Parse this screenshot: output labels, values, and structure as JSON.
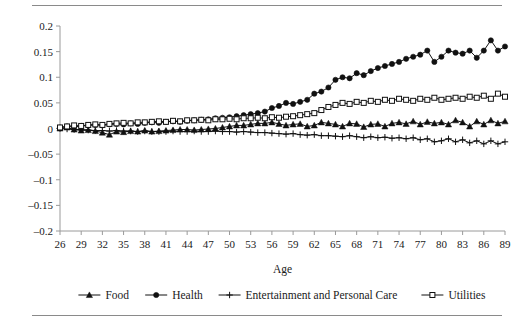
{
  "chart_data": {
    "type": "line",
    "title": "",
    "subtitle": "",
    "xlabel": "Age",
    "ylabel": "",
    "xlim": [
      26,
      89
    ],
    "ylim": [
      -0.2,
      0.2
    ],
    "grid": false,
    "legend_position": "bottom",
    "x_tick_labels": [
      "26",
      "29",
      "32",
      "35",
      "38",
      "41",
      "44",
      "47",
      "50",
      "53",
      "56",
      "59",
      "62",
      "65",
      "68",
      "71",
      "74",
      "77",
      "80",
      "83",
      "86",
      "89"
    ],
    "y_tick_labels": [
      "0.2",
      "0.15",
      "0.1",
      "0.05",
      "0",
      "-0.05",
      "-0.1",
      "-0.15",
      "-0.2"
    ],
    "y_tick_values": [
      0.2,
      0.15,
      0.1,
      0.05,
      0,
      -0.05,
      -0.1,
      -0.15,
      -0.2
    ],
    "x": [
      26,
      27,
      28,
      29,
      30,
      31,
      32,
      33,
      34,
      35,
      36,
      37,
      38,
      39,
      40,
      41,
      42,
      43,
      44,
      45,
      46,
      47,
      48,
      49,
      50,
      51,
      52,
      53,
      54,
      55,
      56,
      57,
      58,
      59,
      60,
      61,
      62,
      63,
      64,
      65,
      66,
      67,
      68,
      69,
      70,
      71,
      72,
      73,
      74,
      75,
      76,
      77,
      78,
      79,
      80,
      81,
      82,
      83,
      84,
      85,
      86,
      87,
      88,
      89
    ],
    "series": [
      {
        "name": "Food",
        "marker": "filled-triangle",
        "color": "#111111",
        "values": [
          0.0,
          0.002,
          -0.002,
          -0.004,
          -0.003,
          -0.005,
          -0.008,
          -0.012,
          -0.006,
          -0.007,
          -0.005,
          -0.006,
          -0.004,
          -0.006,
          -0.005,
          -0.004,
          -0.003,
          -0.002,
          -0.002,
          -0.003,
          -0.002,
          -0.001,
          0.0,
          0.002,
          0.004,
          0.006,
          0.006,
          0.008,
          0.01,
          0.01,
          0.012,
          0.009,
          0.006,
          0.008,
          0.009,
          0.004,
          0.006,
          0.012,
          0.01,
          0.008,
          0.004,
          0.01,
          0.009,
          0.003,
          0.008,
          0.009,
          0.004,
          0.01,
          0.012,
          0.009,
          0.014,
          0.008,
          0.013,
          0.01,
          0.012,
          0.008,
          0.016,
          0.012,
          0.004,
          0.014,
          0.008,
          0.016,
          0.01,
          0.014
        ]
      },
      {
        "name": "Health",
        "marker": "filled-circle",
        "color": "#111111",
        "values": [
          0.002,
          0.004,
          0.003,
          0.005,
          0.006,
          0.007,
          0.006,
          0.008,
          0.009,
          0.008,
          0.01,
          0.009,
          0.011,
          0.012,
          0.011,
          0.013,
          0.014,
          0.013,
          0.015,
          0.016,
          0.017,
          0.018,
          0.02,
          0.021,
          0.022,
          0.024,
          0.026,
          0.028,
          0.03,
          0.033,
          0.04,
          0.044,
          0.05,
          0.048,
          0.052,
          0.056,
          0.068,
          0.072,
          0.08,
          0.095,
          0.1,
          0.098,
          0.108,
          0.104,
          0.112,
          0.118,
          0.122,
          0.126,
          0.13,
          0.136,
          0.14,
          0.144,
          0.152,
          0.13,
          0.14,
          0.152,
          0.148,
          0.146,
          0.152,
          0.138,
          0.152,
          0.172,
          0.152,
          0.16
        ]
      },
      {
        "name": "Entertainment and Personal Care",
        "marker": "plus",
        "color": "#111111",
        "values": [
          0.0,
          -0.001,
          -0.002,
          -0.002,
          -0.003,
          -0.004,
          -0.004,
          -0.005,
          -0.004,
          -0.005,
          -0.005,
          -0.006,
          -0.005,
          -0.006,
          -0.006,
          -0.006,
          -0.005,
          -0.006,
          -0.006,
          -0.005,
          -0.006,
          -0.006,
          -0.005,
          -0.006,
          -0.006,
          -0.007,
          -0.006,
          -0.007,
          -0.008,
          -0.008,
          -0.009,
          -0.01,
          -0.011,
          -0.01,
          -0.012,
          -0.013,
          -0.012,
          -0.014,
          -0.014,
          -0.015,
          -0.016,
          -0.014,
          -0.016,
          -0.018,
          -0.016,
          -0.018,
          -0.017,
          -0.019,
          -0.018,
          -0.02,
          -0.018,
          -0.022,
          -0.02,
          -0.026,
          -0.024,
          -0.02,
          -0.026,
          -0.022,
          -0.028,
          -0.024,
          -0.03,
          -0.024,
          -0.03,
          -0.026
        ]
      },
      {
        "name": "Utilities",
        "marker": "open-square",
        "color": "#111111",
        "values": [
          0.002,
          0.004,
          0.006,
          0.005,
          0.007,
          0.008,
          0.007,
          0.009,
          0.01,
          0.011,
          0.01,
          0.012,
          0.012,
          0.013,
          0.014,
          0.013,
          0.015,
          0.014,
          0.016,
          0.016,
          0.017,
          0.016,
          0.018,
          0.018,
          0.019,
          0.018,
          0.02,
          0.02,
          0.021,
          0.02,
          0.022,
          0.021,
          0.023,
          0.024,
          0.026,
          0.028,
          0.03,
          0.036,
          0.042,
          0.046,
          0.05,
          0.048,
          0.052,
          0.05,
          0.054,
          0.052,
          0.056,
          0.054,
          0.058,
          0.056,
          0.054,
          0.058,
          0.056,
          0.06,
          0.056,
          0.058,
          0.06,
          0.058,
          0.062,
          0.06,
          0.064,
          0.058,
          0.068,
          0.062
        ]
      }
    ]
  },
  "legend": {
    "items": [
      {
        "label": "Food"
      },
      {
        "label": "Health"
      },
      {
        "label": "Entertainment and Personal Care"
      },
      {
        "label": "Utilities"
      }
    ]
  },
  "axes": {
    "x_title": "Age"
  }
}
